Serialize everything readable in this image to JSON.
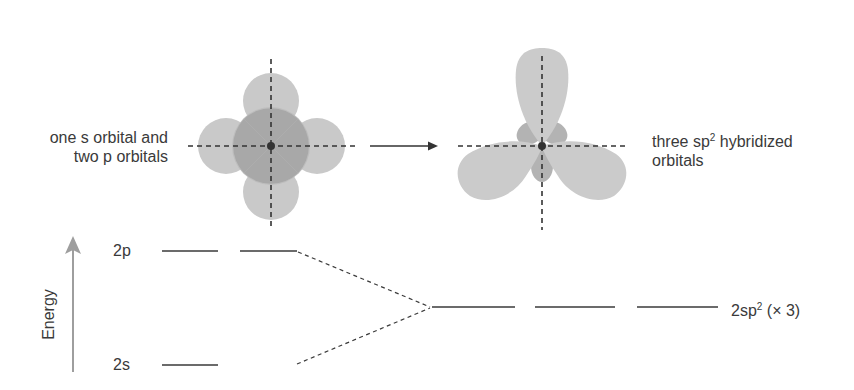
{
  "diagram": {
    "left_orbitals": {
      "label_line1": "one s orbital and",
      "label_line2": "two p orbitals"
    },
    "right_orbitals": {
      "label_line1_pre": "three sp",
      "label_line1_sup": "2",
      "label_line1_post": " hybridized",
      "label_line2": "orbitals"
    },
    "energy_diagram": {
      "axis_label": "Energy",
      "levels": [
        {
          "label": "2p",
          "count": 2
        },
        {
          "label": "2s",
          "count": 1
        }
      ],
      "hybrid": {
        "label_pre": "2sp",
        "label_sup": "2",
        "label_post": " (× 3)",
        "count": 3
      }
    },
    "colors": {
      "lobe_light": "#c8c8c8",
      "lobe_dark": "#a9a9a9",
      "line": "#3a3a3a",
      "energy_arrow": "#9e9e9e"
    }
  }
}
